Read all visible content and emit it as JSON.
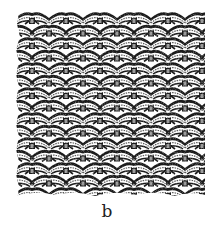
{
  "figure": {
    "panel_label": "b",
    "illustration": "woven-wire-mesh-texture",
    "pattern": {
      "rows": 15,
      "columns": 6,
      "cell_width": 34,
      "row_height": 12.5,
      "colors": {
        "ink": "#1a1a1a",
        "shade": "#5a5a5a",
        "paper": "#ffffff"
      }
    }
  }
}
